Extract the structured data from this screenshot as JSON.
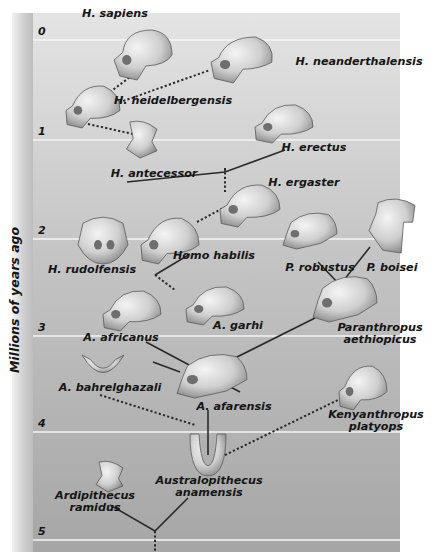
{
  "axis": {
    "label": "Millions of years ago",
    "ticks": [
      {
        "label": "0",
        "y": 40
      },
      {
        "label": "1",
        "y": 140
      },
      {
        "label": "2",
        "y": 239
      },
      {
        "label": "3",
        "y": 336
      },
      {
        "label": "4",
        "y": 432
      },
      {
        "label": "5",
        "y": 540
      }
    ]
  },
  "colors": {
    "background_top": "#e3e3e3",
    "background_bottom": "#a9a9a9",
    "gridline": "#f4f4f4",
    "line": "#2a2a2a",
    "skull_light": "#e6e6e6",
    "skull_dark": "#8c8c8c"
  },
  "species": [
    {
      "id": "h-sapiens",
      "label": "H. sapiens",
      "x": 115,
      "y": 8,
      "align": "center"
    },
    {
      "id": "h-neanderthalensis",
      "label": "H. neanderthalensis",
      "x": 359,
      "y": 56,
      "align": "center"
    },
    {
      "id": "h-heidelbergensis",
      "label": "H. heidelbergensis",
      "x": 173,
      "y": 95,
      "align": "center"
    },
    {
      "id": "h-erectus",
      "label": "H. erectus",
      "x": 314,
      "y": 142,
      "align": "center"
    },
    {
      "id": "h-antecessor",
      "label": "H. antecessor",
      "x": 154,
      "y": 168,
      "align": "center"
    },
    {
      "id": "h-ergaster",
      "label": "H. ergaster",
      "x": 304,
      "y": 177,
      "align": "center"
    },
    {
      "id": "h-rudolfensis",
      "label": "H. rudolfensis",
      "x": 92,
      "y": 264,
      "align": "center"
    },
    {
      "id": "homo-habilis",
      "label": "Homo habilis",
      "x": 214,
      "y": 250,
      "align": "center"
    },
    {
      "id": "p-robustus",
      "label": "P. robustus",
      "x": 320,
      "y": 262,
      "align": "center"
    },
    {
      "id": "p-boisei",
      "label": "P. boisei",
      "x": 392,
      "y": 262,
      "align": "center"
    },
    {
      "id": "a-africanus",
      "label": "A. africanus",
      "x": 121,
      "y": 332,
      "align": "center"
    },
    {
      "id": "a-garhi",
      "label": "A. garhi",
      "x": 238,
      "y": 320,
      "align": "center"
    },
    {
      "id": "paranthropus-aethiopicus",
      "label": "Paranthropus\naethiopicus",
      "x": 380,
      "y": 322,
      "align": "center"
    },
    {
      "id": "a-bahrelghazali",
      "label": "A. bahrelghazali",
      "x": 110,
      "y": 382,
      "align": "center"
    },
    {
      "id": "a-afarensis",
      "label": "A. afarensis",
      "x": 234,
      "y": 401,
      "align": "center"
    },
    {
      "id": "kenyanthropus-platyops",
      "label": "Kenyanthropus\nplatyops",
      "x": 376,
      "y": 409,
      "align": "center"
    },
    {
      "id": "australopithecus-anamensis",
      "label": "Australopithecus\nanamensis",
      "x": 209,
      "y": 475,
      "align": "center"
    },
    {
      "id": "ardipithecus-ramidus",
      "label": "Ardipithecus\nramidus",
      "x": 95,
      "y": 490,
      "align": "center"
    }
  ],
  "skulls": [
    {
      "id": "h-sapiens",
      "cx": 143,
      "cy": 55,
      "w": 58,
      "h": 50,
      "type": "modern"
    },
    {
      "id": "h-neanderthalensis",
      "cx": 243,
      "cy": 60,
      "w": 64,
      "h": 46,
      "type": "neander"
    },
    {
      "id": "h-heidelbergensis",
      "cx": 93,
      "cy": 106,
      "w": 54,
      "h": 44,
      "type": "archaic"
    },
    {
      "id": "h-erectus",
      "cx": 284,
      "cy": 123,
      "w": 58,
      "h": 40,
      "type": "archaic"
    },
    {
      "id": "h-antecessor",
      "cx": 140,
      "cy": 140,
      "w": 34,
      "h": 36,
      "type": "fragment"
    },
    {
      "id": "h-ergaster",
      "cx": 250,
      "cy": 205,
      "w": 60,
      "h": 44,
      "type": "archaic"
    },
    {
      "id": "h-rudolfensis",
      "cx": 103,
      "cy": 240,
      "w": 50,
      "h": 48,
      "type": "front"
    },
    {
      "id": "homo-habilis",
      "cx": 170,
      "cy": 240,
      "w": 58,
      "h": 48,
      "type": "archaic"
    },
    {
      "id": "p-robustus",
      "cx": 310,
      "cy": 230,
      "w": 54,
      "h": 38,
      "type": "robust"
    },
    {
      "id": "p-boisei",
      "cx": 392,
      "cy": 225,
      "w": 46,
      "h": 56,
      "type": "boisei"
    },
    {
      "id": "a-africanus",
      "cx": 132,
      "cy": 310,
      "w": 58,
      "h": 42,
      "type": "archaic"
    },
    {
      "id": "a-garhi",
      "cx": 215,
      "cy": 305,
      "w": 58,
      "h": 40,
      "type": "archaic"
    },
    {
      "id": "paranthropus-aethiopicus",
      "cx": 345,
      "cy": 298,
      "w": 64,
      "h": 48,
      "type": "robust"
    },
    {
      "id": "a-bahrelghazali",
      "cx": 103,
      "cy": 366,
      "w": 42,
      "h": 22,
      "type": "jaw"
    },
    {
      "id": "a-afarensis",
      "cx": 212,
      "cy": 375,
      "w": 70,
      "h": 46,
      "type": "robust"
    },
    {
      "id": "kenyanthropus-platyops",
      "cx": 363,
      "cy": 387,
      "w": 48,
      "h": 46,
      "type": "archaic"
    },
    {
      "id": "australopithecus-anamensis",
      "cx": 208,
      "cy": 455,
      "w": 36,
      "h": 42,
      "type": "mandible"
    },
    {
      "id": "ardipithecus-ramidus",
      "cx": 108,
      "cy": 477,
      "w": 30,
      "h": 30,
      "type": "fragment"
    }
  ],
  "connections": {
    "solid": [
      [
        [
          127,
          182
        ],
        [
          225,
          172
        ],
        [
          285,
          150
        ]
      ],
      [
        [
          225,
          172
        ],
        [
          225,
          168
        ]
      ],
      [
        [
          155,
          275
        ],
        [
          190,
          254
        ]
      ],
      [
        [
          340,
          285
        ],
        [
          318,
          262
        ]
      ],
      [
        [
          340,
          285
        ],
        [
          370,
          247
        ]
      ],
      [
        [
          153,
          362
        ],
        [
          180,
          372
        ]
      ],
      [
        [
          146,
          342
        ],
        [
          240,
          392
        ]
      ],
      [
        [
          215,
          368
        ],
        [
          315,
          318
        ]
      ],
      [
        [
          208,
          410
        ],
        [
          208,
          455
        ]
      ],
      [
        [
          110,
          505
        ],
        [
          155,
          531
        ],
        [
          188,
          498
        ]
      ]
    ],
    "dotted": [
      [
        [
          110,
          92
        ],
        [
          134,
          74
        ]
      ],
      [
        [
          115,
          104
        ],
        [
          210,
          70
        ]
      ],
      [
        [
          88,
          124
        ],
        [
          133,
          134
        ]
      ],
      [
        [
          225,
          168
        ],
        [
          225,
          192
        ]
      ],
      [
        [
          197,
          222
        ],
        [
          225,
          207
        ]
      ],
      [
        [
          155,
          275
        ],
        [
          175,
          290
        ]
      ],
      [
        [
          100,
          395
        ],
        [
          195,
          425
        ]
      ],
      [
        [
          225,
          455
        ],
        [
          342,
          398
        ]
      ],
      [
        [
          155,
          531
        ],
        [
          155,
          552
        ]
      ]
    ]
  }
}
